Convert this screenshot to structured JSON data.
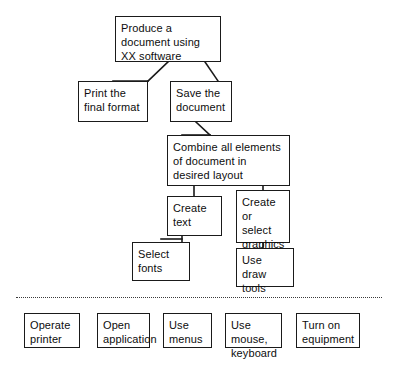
{
  "diagram": {
    "type": "hierarchical-task-analysis-tree",
    "title_node": "Produce a document using XX software",
    "colors": {
      "box_border": "#1a1a1a",
      "text": "#0d0d0d",
      "background": "#ffffff",
      "connector": "#1a1a1a",
      "divider": "#3a3a3a"
    },
    "nodes": {
      "root": {
        "label": "Produce a document using XX software",
        "x": 115,
        "y": 16,
        "w": 106,
        "h": 46
      },
      "print": {
        "label": "Print the final format",
        "x": 78,
        "y": 81,
        "w": 70,
        "h": 41
      },
      "save": {
        "label": "Save the document",
        "x": 170,
        "y": 81,
        "w": 62,
        "h": 41
      },
      "combine": {
        "label": "Combine all elements of document in desired layout",
        "x": 167,
        "y": 135,
        "w": 123,
        "h": 51
      },
      "create_text": {
        "label": "Create text",
        "x": 167,
        "y": 196,
        "w": 55,
        "h": 40
      },
      "create_graphics": {
        "label": "Create or select graphics",
        "x": 236,
        "y": 190,
        "w": 54,
        "h": 53
      },
      "select_fonts": {
        "label": "Select fonts",
        "x": 132,
        "y": 242,
        "w": 58,
        "h": 39
      },
      "draw_tools": {
        "label": "Use draw tools",
        "x": 236,
        "y": 248,
        "w": 58,
        "h": 39
      }
    },
    "divider": {
      "name": "dotted-separator",
      "x": 16,
      "y": 297,
      "w": 366
    },
    "bottom_row": [
      {
        "label": "Operate printer",
        "x": 24,
        "y": 313,
        "w": 56,
        "h": 35
      },
      {
        "label": "Open application",
        "x": 97,
        "y": 313,
        "w": 53,
        "h": 35
      },
      {
        "label": "Use menus",
        "x": 163,
        "y": 313,
        "w": 49,
        "h": 35
      },
      {
        "label": "Use mouse, keyboard",
        "x": 225,
        "y": 313,
        "w": 57,
        "h": 35
      },
      {
        "label": "Turn on equipment",
        "x": 296,
        "y": 313,
        "w": 64,
        "h": 35
      }
    ]
  }
}
